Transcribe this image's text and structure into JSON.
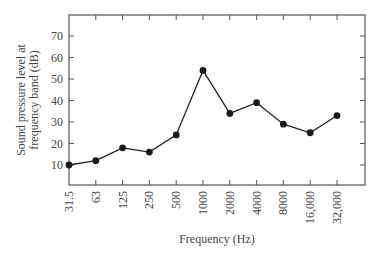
{
  "chart_data": {
    "type": "line",
    "title": "",
    "xlabel": "Frequency (Hz)",
    "ylabel_lines": [
      "Sound pressure level at",
      "frequency band (dB)"
    ],
    "ylabel": "Sound pressure level at frequency band (dB)",
    "categories": [
      "31.5",
      "63",
      "125",
      "250",
      "500",
      "1000",
      "2000",
      "4000",
      "8000",
      "16,000",
      "32,000"
    ],
    "values": [
      10,
      12,
      18,
      16,
      24,
      54,
      34,
      39,
      29,
      25,
      33
    ],
    "y_ticks": [
      10,
      20,
      30,
      40,
      50,
      60,
      70
    ],
    "ylim": [
      0,
      80
    ],
    "grid": false,
    "legend": null,
    "colors": {
      "line": "#222222",
      "marker": "#1a1a1a",
      "axis": "#555555"
    }
  }
}
